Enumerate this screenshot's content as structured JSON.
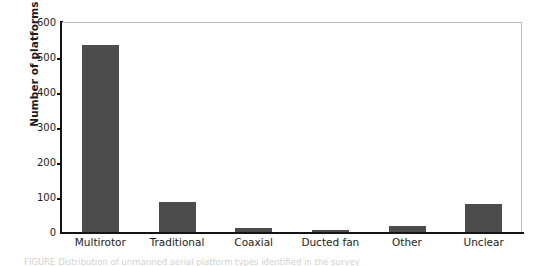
{
  "chart_data": {
    "type": "bar",
    "title": "",
    "xlabel": "",
    "ylabel": "Number of platforms",
    "categories": [
      "Multirotor",
      "Traditional",
      "Coaxial",
      "Ducted fan",
      "Other",
      "Unclear"
    ],
    "values": [
      535,
      87,
      11,
      6,
      18,
      80
    ],
    "ylim": [
      0,
      600
    ],
    "yticks": [
      0,
      100,
      200,
      300,
      400,
      500,
      600
    ],
    "ytick_labels": [
      "0",
      "100",
      "200",
      "300",
      "400",
      "500",
      "600"
    ],
    "grid": false,
    "legend": null,
    "bar_color": "#4c4c4c",
    "axis_color": "#141414",
    "frame_color": "#b9b9b9",
    "background": "#ffffff"
  },
  "caption": {
    "text": "FIGURE  Distribution of unmanned aerial platform types identified in the survey"
  }
}
